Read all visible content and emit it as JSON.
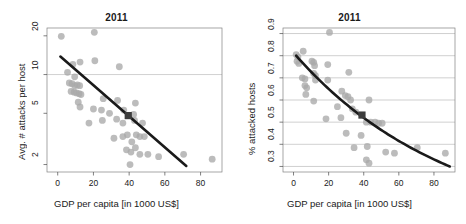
{
  "figure": {
    "background": "#ffffff",
    "point_color": "#a9a9a9",
    "line_color": "#1a1a1a",
    "grid_color": "#b0b0b0",
    "frame_color": "#808080",
    "highlight_color": "#3d3d3d"
  },
  "chart_data": [
    {
      "type": "scatter",
      "panel": "left",
      "title": "2011",
      "xlabel": "GDP per capita [in 1000 US$]",
      "ylabel": "Avg. # attacks per host",
      "xscale": "linear",
      "yscale": "log",
      "xlim": [
        -6,
        92
      ],
      "ylim": [
        1.75,
        23
      ],
      "xticks": [
        0,
        20,
        40,
        60,
        80
      ],
      "yticks": [
        2,
        5,
        10,
        20
      ],
      "xtick_labels": [
        "0",
        "20",
        "40",
        "60",
        "80"
      ],
      "ytick_labels": [
        "2",
        "5",
        "10",
        "20"
      ],
      "grid": "horizontal-at-10-only",
      "legend": "none",
      "points": [
        [
          2.0,
          19.8
        ],
        [
          20.5,
          21.3
        ],
        [
          8.5,
          12.0
        ],
        [
          12.5,
          12.5
        ],
        [
          20.8,
          12.8
        ],
        [
          34.5,
          11.5
        ],
        [
          5.5,
          10.4
        ],
        [
          9.5,
          9.6
        ],
        [
          6.5,
          8.6
        ],
        [
          8.0,
          8.5
        ],
        [
          9.5,
          8.2
        ],
        [
          11.0,
          8.3
        ],
        [
          12.3,
          8.2
        ],
        [
          7.5,
          7.4
        ],
        [
          9.2,
          7.3
        ],
        [
          10.5,
          7.2
        ],
        [
          12.0,
          7.1
        ],
        [
          13.0,
          7.0
        ],
        [
          11.5,
          6.1
        ],
        [
          25.5,
          6.5
        ],
        [
          33.5,
          6.3
        ],
        [
          43.5,
          6.0
        ],
        [
          12.5,
          5.6
        ],
        [
          20.0,
          5.4
        ],
        [
          24.5,
          5.3
        ],
        [
          29.0,
          5.0
        ],
        [
          37.0,
          5.3
        ],
        [
          42.5,
          4.9
        ],
        [
          17.5,
          4.2
        ],
        [
          25.0,
          4.4
        ],
        [
          33.0,
          4.5
        ],
        [
          36.5,
          4.2
        ],
        [
          43.0,
          4.4
        ],
        [
          47.5,
          4.2
        ],
        [
          31.5,
          3.2
        ],
        [
          36.5,
          3.3
        ],
        [
          39.0,
          3.4
        ],
        [
          41.5,
          3.0
        ],
        [
          44.0,
          3.4
        ],
        [
          46.0,
          3.3
        ],
        [
          48.5,
          3.3
        ],
        [
          38.5,
          2.6
        ],
        [
          41.0,
          2.5
        ],
        [
          43.5,
          2.7
        ],
        [
          46.0,
          2.4
        ],
        [
          50.5,
          2.4
        ],
        [
          56.5,
          2.3
        ],
        [
          70.5,
          2.4
        ],
        [
          86.5,
          2.2
        ],
        [
          40.5,
          2.0
        ]
      ],
      "trend_line": {
        "type": "log-linear",
        "x_start": 1.5,
        "x_end": 72.0,
        "y_start": 13.8,
        "y_end": 1.95
      },
      "highlight_point": {
        "x": 39.5,
        "y": 4.8,
        "marker": "square"
      }
    },
    {
      "type": "scatter",
      "panel": "right",
      "title": "2011",
      "xlabel": "GDP per capita [in 1000 US$]",
      "ylabel": "% attacked hosts",
      "xscale": "linear",
      "yscale": "linear",
      "xlim": [
        -6,
        92
      ],
      "ylim": [
        0.275,
        0.925
      ],
      "xticks": [
        0,
        20,
        40,
        60,
        80
      ],
      "yticks": [
        0.3,
        0.4,
        0.5,
        0.6,
        0.7,
        0.8,
        0.9
      ],
      "xtick_labels": [
        "0",
        "20",
        "40",
        "60",
        "80"
      ],
      "ytick_labels": [
        "0.3",
        "0.4",
        "0.5",
        "0.6",
        "0.7",
        "0.8",
        "0.9"
      ],
      "grid": "horizontal-all-ticks",
      "legend": "none",
      "points": [
        [
          20.5,
          0.905
        ],
        [
          1.5,
          0.805
        ],
        [
          2.5,
          0.795
        ],
        [
          5.5,
          0.82
        ],
        [
          2.0,
          0.775
        ],
        [
          3.0,
          0.765
        ],
        [
          10.5,
          0.775
        ],
        [
          11.5,
          0.77
        ],
        [
          12.0,
          0.755
        ],
        [
          19.5,
          0.76
        ],
        [
          5.0,
          0.7
        ],
        [
          6.5,
          0.695
        ],
        [
          11.5,
          0.72
        ],
        [
          12.5,
          0.71
        ],
        [
          31.5,
          0.725
        ],
        [
          6.5,
          0.665
        ],
        [
          7.5,
          0.655
        ],
        [
          12.5,
          0.69
        ],
        [
          19.5,
          0.69
        ],
        [
          27.5,
          0.64
        ],
        [
          7.0,
          0.625
        ],
        [
          29.5,
          0.62
        ],
        [
          31.0,
          0.615
        ],
        [
          11.5,
          0.595
        ],
        [
          32.5,
          0.6
        ],
        [
          43.0,
          0.6
        ],
        [
          25.0,
          0.57
        ],
        [
          33.5,
          0.56
        ],
        [
          35.5,
          0.545
        ],
        [
          18.5,
          0.515
        ],
        [
          27.0,
          0.52
        ],
        [
          41.5,
          0.5
        ],
        [
          44.0,
          0.5
        ],
        [
          46.5,
          0.5
        ],
        [
          48.5,
          0.495
        ],
        [
          50.5,
          0.495
        ],
        [
          30.0,
          0.45
        ],
        [
          38.5,
          0.44
        ],
        [
          34.5,
          0.385
        ],
        [
          42.0,
          0.39
        ],
        [
          52.5,
          0.365
        ],
        [
          57.5,
          0.36
        ],
        [
          41.5,
          0.33
        ],
        [
          43.0,
          0.315
        ],
        [
          70.5,
          0.385
        ],
        [
          86.5,
          0.36
        ]
      ],
      "trend_line": {
        "type": "decaying-curve",
        "x_start": 1.5,
        "x_end": 89.0,
        "y_start": 0.8,
        "y_end": 0.3
      },
      "highlight_point": {
        "x": 39.0,
        "y": 0.532,
        "marker": "square"
      }
    }
  ]
}
